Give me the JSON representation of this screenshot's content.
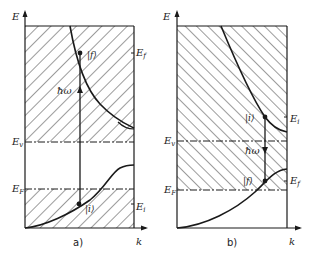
{
  "figure": {
    "colors": {
      "ink": "#1a1a1a",
      "hatch": "#3a3a3a",
      "background": "#ffffff"
    },
    "panels": [
      {
        "id": "a",
        "caption": "a)",
        "axis_y_label": "E",
        "axis_x_label": "k",
        "level_labels": {
          "ev": "E",
          "ev_sub": "v",
          "ef": "E",
          "ef_sub": "F"
        },
        "state_final": "|f⟩",
        "state_initial": "|i⟩",
        "energy_final": "E",
        "energy_final_sub": "f",
        "energy_initial": "E",
        "energy_initial_sub": "i",
        "photon": "ħω",
        "transition": "absorption (upward)"
      },
      {
        "id": "b",
        "caption": "b)",
        "axis_y_label": "E",
        "axis_x_label": "k",
        "level_labels": {
          "ev": "E",
          "ev_sub": "v",
          "ef": "E",
          "ef_sub": "F"
        },
        "state_initial": "|i⟩",
        "state_final": "|f⟩",
        "energy_initial": "E",
        "energy_initial_sub": "i",
        "energy_final": "E",
        "energy_final_sub": "f",
        "photon": "ħω",
        "transition": "emission (downward)"
      }
    ]
  }
}
